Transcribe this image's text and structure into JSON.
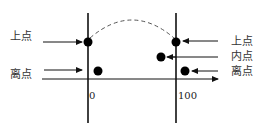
{
  "diagram": {
    "labels": {
      "left_on_point": "上点",
      "left_off_point": "离点",
      "right_on_point": "上点",
      "right_in_point": "内点",
      "right_off_point": "离点"
    },
    "ticks": {
      "lower_bound": "0",
      "upper_bound": "100"
    },
    "colors": {
      "line": "#111111",
      "point": "#000000",
      "text": "#333333"
    }
  }
}
